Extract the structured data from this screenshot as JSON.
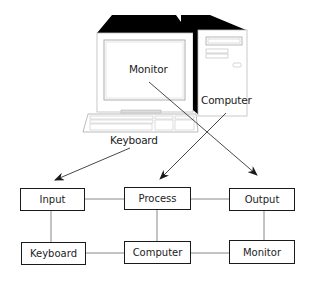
{
  "illustration": {
    "labels": {
      "monitor": "Monitor",
      "computer": "Computer",
      "keyboard": "Keyboard"
    }
  },
  "flow": {
    "top_row": [
      {
        "id": "input",
        "label": "Input"
      },
      {
        "id": "process",
        "label": "Process"
      },
      {
        "id": "output",
        "label": "Output"
      }
    ],
    "bottom_row": [
      {
        "id": "keyboard",
        "label": "Keyboard"
      },
      {
        "id": "computer",
        "label": "Computer"
      },
      {
        "id": "monitor",
        "label": "Monitor"
      }
    ],
    "arrows": [
      {
        "from": "Keyboard (illustration)",
        "to": "Input"
      },
      {
        "from": "Computer (illustration)",
        "to": "Process"
      },
      {
        "from": "Monitor (illustration)",
        "to": "Output"
      }
    ]
  },
  "colors": {
    "line": "#1a1a1a",
    "connector": "#777777",
    "fill": "#ffffff",
    "shadow": "#000000"
  }
}
